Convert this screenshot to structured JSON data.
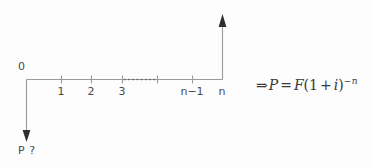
{
  "figure": {
    "background_color": "#fdfdfd",
    "line_color": "#9a9a9a",
    "text_color": "#4a4a4a",
    "arrow_color": "#2e2e2e"
  },
  "timeline": {
    "origin_label": "0",
    "ticks": [
      {
        "label": "1",
        "x": 61
      },
      {
        "label": "2",
        "x": 91
      },
      {
        "label": "3",
        "x": 122
      },
      {
        "label": "n−1",
        "x": 192
      },
      {
        "label": "n",
        "x": 222
      }
    ],
    "break_label": "…",
    "axis_start_x": 26,
    "axis_end_x": 222,
    "axis_y": 79
  },
  "cash_flows": [
    {
      "name": "present-worth-outflow",
      "label": "P ?",
      "direction": "down",
      "at_period": "0"
    },
    {
      "name": "future-worth-inflow",
      "label": "n",
      "direction": "up",
      "at_period": "n"
    }
  ],
  "formula": {
    "implies_symbol": "⇒",
    "left_side": "P",
    "equals": "=",
    "coefficient": "F",
    "open_paren": "(",
    "base_one": "1",
    "plus": "+",
    "rate": "i",
    "close_paren": ")",
    "exponent_sign": "−",
    "exponent": "n",
    "plain_text": "⇒ P = F(1 + i)⁻ⁿ"
  }
}
